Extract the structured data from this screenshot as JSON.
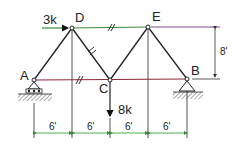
{
  "diagram": {
    "type": "truss",
    "joints": {
      "A": {
        "label": "A",
        "x": 34,
        "y": 80
      },
      "B": {
        "label": "B",
        "x": 187,
        "y": 79
      },
      "C": {
        "label": "C",
        "x": 110,
        "y": 80
      },
      "D": {
        "label": "D",
        "x": 72,
        "y": 28
      },
      "E": {
        "label": "E",
        "x": 148,
        "y": 27
      }
    },
    "members": [
      {
        "from": "A",
        "to": "D"
      },
      {
        "from": "D",
        "to": "C"
      },
      {
        "from": "C",
        "to": "E"
      },
      {
        "from": "E",
        "to": "B"
      },
      {
        "from": "D",
        "to": "E"
      },
      {
        "from": "A",
        "to": "C"
      },
      {
        "from": "C",
        "to": "B"
      }
    ],
    "supports": {
      "A": "roller",
      "B": "pin"
    },
    "loads": [
      {
        "joint": "D",
        "label": "3k",
        "direction": "right"
      },
      {
        "joint": "C",
        "label": "8k",
        "direction": "down"
      }
    ],
    "dimensions": {
      "horizontal": [
        "6'",
        "6'",
        "6'",
        "6'"
      ],
      "vertical": "8'"
    },
    "colors": {
      "member": "#222222",
      "top_chord": "#3a8a3a",
      "bottom_chord": "#8a2a3a",
      "dimension": "#4caf50",
      "extension": "#555555",
      "purple_line": "#7a4a8a"
    }
  }
}
